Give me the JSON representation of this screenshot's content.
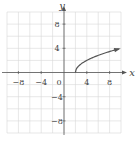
{
  "chart_data": {
    "type": "line",
    "title": "",
    "xlabel": "x",
    "ylabel": "y",
    "xlim": [
      -10,
      10
    ],
    "ylim": [
      -10,
      10
    ],
    "grid": true,
    "grid_step": 2,
    "x_ticks": [
      -8,
      -4,
      0,
      4,
      8
    ],
    "y_ticks": [
      8,
      4,
      -4,
      -8
    ],
    "x_tick_labels": [
      "−8",
      "−4",
      "0",
      "4",
      "8"
    ],
    "y_tick_labels": [
      "8",
      "4",
      "−4",
      "−8"
    ],
    "series": [
      {
        "name": "curve",
        "function": "y = sqrt(2x - 4)",
        "x": [
          2,
          2.5,
          3,
          4,
          5,
          6,
          7,
          8,
          9,
          9.6
        ],
        "y": [
          0,
          1.0,
          1.41,
          2.0,
          2.45,
          2.83,
          3.16,
          3.46,
          3.74,
          3.9
        ],
        "arrow_end": true,
        "color": "#555555"
      }
    ],
    "legend": null
  }
}
